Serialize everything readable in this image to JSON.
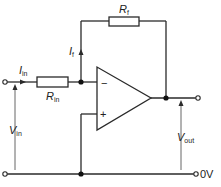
{
  "diagram": {
    "type": "inverting-op-amp-circuit",
    "colors": {
      "line": "#2a2a2a",
      "background": "#ffffff"
    },
    "components": {
      "feedback_resistor": {
        "symbol": "R",
        "subscript": "f"
      },
      "input_resistor": {
        "symbol": "R",
        "subscript": "in"
      },
      "op_amp": {
        "inverting_sign": "−",
        "noninverting_sign": "+"
      }
    },
    "labels": {
      "feedback_current": {
        "symbol": "I",
        "subscript": "f"
      },
      "input_current": {
        "symbol": "I",
        "subscript": "in"
      },
      "input_voltage": {
        "symbol": "V",
        "subscript": "in"
      },
      "output_voltage": {
        "symbol": "V",
        "subscript": "out"
      },
      "ground": "0V"
    }
  }
}
